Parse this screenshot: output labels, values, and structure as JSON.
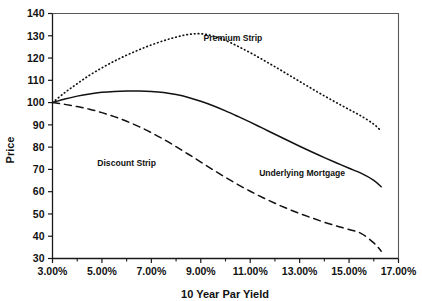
{
  "chart_data": {
    "type": "line",
    "title": "",
    "xlabel": "10 Year Par Yield",
    "ylabel": "Price",
    "xlim": [
      3.0,
      17.0
    ],
    "ylim": [
      30,
      140
    ],
    "grid": false,
    "legend_position": "inline-annotations",
    "x_tick_labels": [
      "3.00%",
      "5.00%",
      "7.00%",
      "9.00%",
      "11.00%",
      "13.00%",
      "15.00%",
      "17.00%"
    ],
    "x_tick_values": [
      3,
      5,
      7,
      9,
      11,
      13,
      15,
      17
    ],
    "x_minor_tick_values": [
      4,
      6,
      8,
      10,
      12,
      14,
      16
    ],
    "y_tick_labels": [
      "30",
      "40",
      "50",
      "60",
      "70",
      "80",
      "90",
      "100",
      "110",
      "120",
      "130",
      "140"
    ],
    "y_tick_values": [
      30,
      40,
      50,
      60,
      70,
      80,
      90,
      100,
      110,
      120,
      130,
      140
    ],
    "x": [
      3.0,
      3.5,
      4.0,
      4.5,
      5.0,
      5.5,
      6.0,
      6.5,
      7.0,
      7.5,
      8.0,
      8.5,
      9.0,
      9.5,
      10.0,
      10.5,
      11.0,
      11.5,
      12.0,
      12.5,
      13.0,
      13.5,
      14.0,
      14.5,
      15.0,
      15.5,
      16.0,
      16.3
    ],
    "series": [
      {
        "name": "Premium Strip",
        "style": "dotted",
        "label_x": 10.3,
        "label_y": 127.5,
        "values": [
          100.0,
          104.5,
          108.5,
          112.3,
          115.6,
          118.6,
          121.3,
          123.7,
          125.9,
          127.8,
          129.4,
          130.6,
          130.9,
          129.9,
          127.9,
          125.3,
          122.4,
          119.3,
          116.1,
          112.8,
          109.5,
          106.2,
          103.0,
          99.9,
          96.9,
          93.9,
          90.3,
          87.2
        ]
      },
      {
        "name": "Underlying Mortgage",
        "style": "solid",
        "label_x": 13.1,
        "label_y": 67.0,
        "values": [
          100.0,
          101.6,
          102.9,
          103.9,
          104.6,
          105.0,
          105.2,
          105.2,
          105.0,
          104.5,
          103.6,
          102.3,
          100.6,
          98.6,
          96.3,
          93.8,
          91.2,
          88.5,
          85.8,
          83.1,
          80.4,
          77.8,
          75.3,
          72.9,
          70.5,
          68.2,
          65.1,
          62.2
        ]
      },
      {
        "name": "Discount Strip",
        "style": "dashed",
        "label_x": 6.0,
        "label_y": 71.5,
        "values": [
          100.0,
          99.2,
          98.2,
          97.0,
          95.5,
          93.7,
          91.6,
          89.2,
          86.5,
          83.5,
          80.2,
          76.8,
          73.3,
          69.8,
          66.4,
          63.2,
          60.2,
          57.4,
          54.8,
          52.4,
          50.2,
          48.2,
          46.3,
          44.6,
          43.0,
          41.2,
          37.0,
          33.3
        ]
      }
    ]
  }
}
